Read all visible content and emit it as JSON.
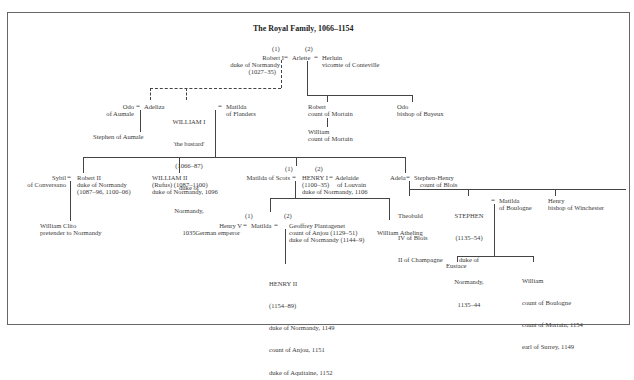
{
  "title": "The Royal Family, 1066–1154",
  "people": {
    "robert1": {
      "marriage_no": "(1)",
      "name": "Robert I",
      "line2": "duke of Normandy",
      "line3": "(1027–35)"
    },
    "arlette": {
      "name": "Arlette"
    },
    "herluin": {
      "marriage_no": "(2)",
      "name": "Herluin",
      "line2": "vicomte of Conteville"
    },
    "odo_aumale": {
      "name": "Odo",
      "line2": "of Aumale"
    },
    "adeliza": {
      "name": "Adeliza"
    },
    "stephen_aumale": {
      "name": "Stephen of Aumale"
    },
    "william1": {
      "name": "WILLIAM I",
      "line2": "'the bastard'",
      "line3": "(1066–87)",
      "line4": "duke of",
      "line5": "Normandy,",
      "line6": "1035"
    },
    "matilda_flanders": {
      "name": "Matilda",
      "line2": "of Flanders"
    },
    "robert_mortain": {
      "name": "Robert",
      "line2": "count of Mortain"
    },
    "william_mortain": {
      "name": "William",
      "line2": "count of Mortain"
    },
    "odo_bayeux": {
      "name": "Odo",
      "line2": "bishop of Bayeux"
    },
    "sybil": {
      "name": "Sybil",
      "line2": "of Conversano"
    },
    "robert2": {
      "name": "Robert II",
      "line2": "duke of Normandy",
      "line3": "(1087–96, 1100–06)"
    },
    "william_clito": {
      "name": "William Clito",
      "line2": "pretender to Normandy"
    },
    "william2": {
      "name": "WILLIAM II",
      "line2": "(Rufus) (1087–1100)",
      "line3": "duke of Normandy, 1096"
    },
    "matilda_scots": {
      "marriage_no": "(1)",
      "name": "Matilda of Scots"
    },
    "henry1": {
      "name": "HENRY I",
      "line2": "(1100–35)",
      "line3": "duke of Normandy, 1106"
    },
    "adelaide": {
      "marriage_no": "(2)",
      "name": "Adelaide",
      "line2": "of Louvain"
    },
    "adela": {
      "name": "Adela"
    },
    "stephen_henry": {
      "name": "Stephen-Henry",
      "line2": "count of Blois"
    },
    "henry5": {
      "marriage_no": "(1)",
      "name": "Henry V",
      "line2": "German emperor"
    },
    "matilda": {
      "name": "Matilda"
    },
    "geoffrey": {
      "marriage_no": "(2)",
      "name": "Geoffrey Plantagenet",
      "line2": "count of Anjou (1129–51)",
      "line3": "duke of Normandy (1144–9)"
    },
    "william_atheling": {
      "name": "William Atheling"
    },
    "henry2": {
      "name": "HENRY II",
      "line2": "(1154–89)",
      "line3": "duke of Normandy, 1149",
      "line4": "count of Anjou, 1151",
      "line5": "duke of Aquitaine, 1152"
    },
    "theobald": {
      "name": "Theobald",
      "line2": "IV of Blois",
      "line3": "II of Champagne"
    },
    "stephen": {
      "name": "STEPHEN",
      "line2": "(1135–54)",
      "line3": "duke of",
      "line4": "Normandy,",
      "line5": "1135–44"
    },
    "matilda_boulogne": {
      "name": "Matilda",
      "line2": "of Boulogne"
    },
    "henry_winchester": {
      "name": "Henry",
      "line2": "bishop of Winchester"
    },
    "eustace": {
      "name": "Eustace"
    },
    "william_boulogne": {
      "name": "William",
      "line2": "count of Boulogne",
      "line3": "count of Mortain, 1154",
      "line4": "earl of Surrey, 1149"
    }
  },
  "symbols": {
    "married": "="
  }
}
